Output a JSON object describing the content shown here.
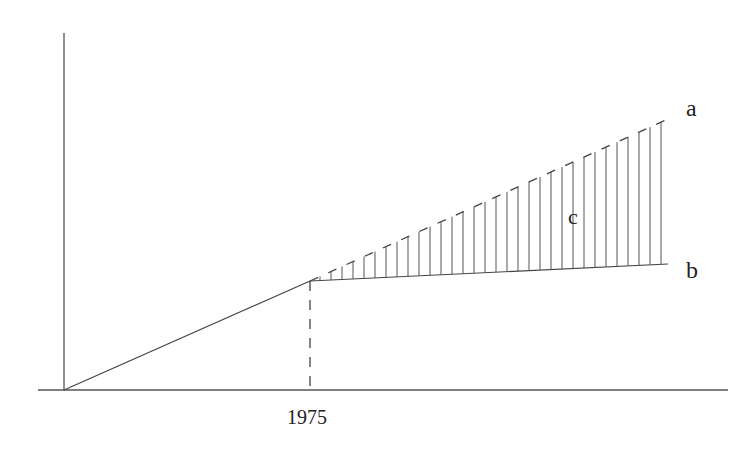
{
  "diagram": {
    "labels": {
      "line_a": "a",
      "line_b": "b",
      "area_c": "c",
      "x_marker": "1975"
    },
    "colors": {
      "stroke": "#444444",
      "text": "#222222",
      "background": "#ffffff"
    }
  },
  "chart_data": {
    "type": "line",
    "title": "",
    "xlabel": "",
    "ylabel": "",
    "x_tick_labels": [
      "1975"
    ],
    "series": [
      {
        "name": "trend (before 1975)",
        "style": "solid",
        "points": [
          [
            0,
            0
          ],
          [
            1,
            1
          ]
        ]
      },
      {
        "name": "a",
        "style": "dashed",
        "points": [
          [
            1,
            1
          ],
          [
            2.46,
            2.47
          ]
        ]
      },
      {
        "name": "b",
        "style": "solid",
        "points": [
          [
            1,
            1
          ],
          [
            2.46,
            1.16
          ]
        ]
      }
    ],
    "shaded_region": {
      "name": "c",
      "between": [
        "a",
        "b"
      ],
      "from_x": 1,
      "pattern": "vertical hatching"
    },
    "markers": [
      {
        "x": 1,
        "label": "1975",
        "style": "dashed vertical line"
      }
    ],
    "grid": false,
    "legend": "none (inline labels a, b, c)"
  }
}
